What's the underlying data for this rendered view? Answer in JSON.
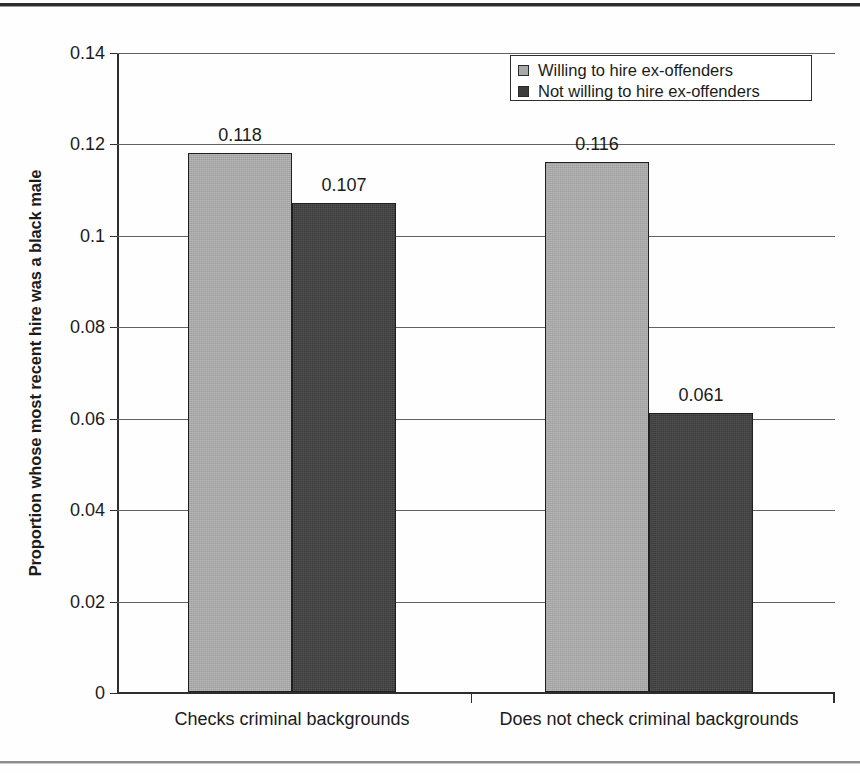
{
  "chart_data": {
    "type": "bar",
    "title": "",
    "xlabel": "",
    "ylabel": "Proportion whose most recent hire was a black male",
    "ylim": [
      0,
      0.14
    ],
    "ytick_labels": [
      "0.14",
      "0.12",
      "0.1",
      "0.08",
      "0.06",
      "0.04",
      "0.02",
      "0"
    ],
    "ytick_values": [
      0.14,
      0.12,
      0.1,
      0.08,
      0.06,
      0.04,
      0.02,
      0
    ],
    "grid": true,
    "legend_position": "top-right",
    "categories": [
      "Checks criminal backgrounds",
      "Does not check criminal backgrounds"
    ],
    "series": [
      {
        "name": "Willing to hire ex-offenders",
        "color": "#a8a8a8",
        "values": [
          0.118,
          0.116
        ],
        "labels": [
          "0.118",
          "0.116"
        ]
      },
      {
        "name": "Not willing to hire ex-offenders",
        "color": "#3a3a3a",
        "values": [
          0.107,
          0.061
        ],
        "labels": [
          "0.107",
          "0.061"
        ]
      }
    ]
  },
  "legend": {
    "items": [
      {
        "label": "Willing to hire ex-offenders",
        "swatch": "light-gray-square-icon"
      },
      {
        "label": "Not willing to hire ex-offenders",
        "swatch": "dark-gray-square-icon"
      }
    ]
  },
  "axis": {
    "y_title": "Proportion whose most recent hire was a black male"
  }
}
